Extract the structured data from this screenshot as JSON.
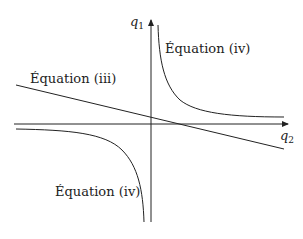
{
  "diagram": {
    "axes": {
      "vertical_label": "q",
      "vertical_sub": "1",
      "horizontal_label": "q",
      "horizontal_sub": "2"
    },
    "curves": [
      {
        "name": "upper-hyperbola",
        "label": "Équation (iv)"
      },
      {
        "name": "line",
        "label": "Équation (iii)"
      },
      {
        "name": "lower-hyperbola",
        "label": "Équation (iv)"
      }
    ],
    "colors": {
      "stroke": "#222222",
      "background": "#ffffff"
    }
  }
}
